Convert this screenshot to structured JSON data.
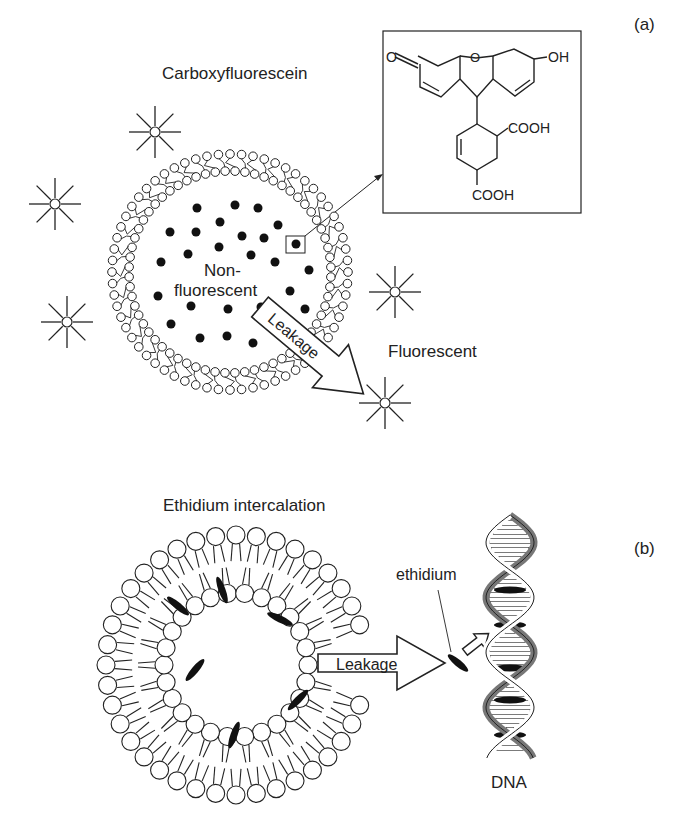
{
  "panel_a": {
    "label": "(a)",
    "title": "Carboxyfluorescein",
    "inside_label_line1": "Non-",
    "inside_label_line2": "fluorescent",
    "leak_label": "Leakage",
    "outside_label": "Fluorescent",
    "structure": {
      "ketone": "O",
      "ring_oxygen": "O",
      "hydroxyl": "OH",
      "carboxyl_1": "COOH",
      "carboxyl_2": "COOH"
    }
  },
  "panel_b": {
    "label": "(b)",
    "title": "Ethidium intercalation",
    "leak_label": "Leakage",
    "ethidium_label": "ethidium",
    "dna_label": "DNA"
  },
  "colors": {
    "ink": "#222222",
    "dna_strand": "#777777"
  }
}
